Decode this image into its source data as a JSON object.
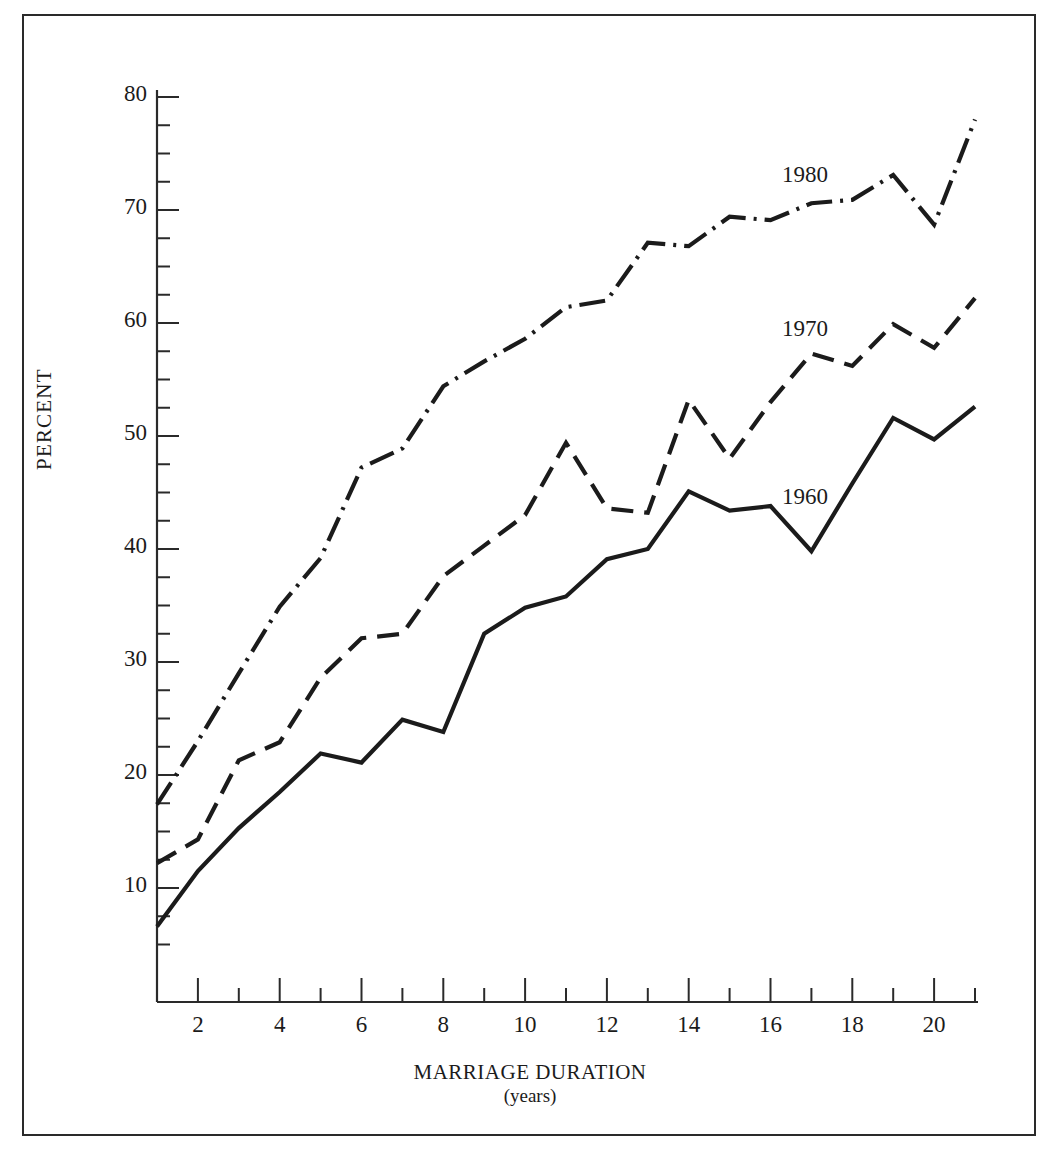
{
  "figure": {
    "border_color": "#2a2a2a",
    "background": "#ffffff"
  },
  "axes": {
    "y_title": "PERCENT",
    "x_title": "MARRIAGE  DURATION",
    "x_subtitle": "(years)",
    "y_tick_labels": [
      "80",
      "70",
      "60",
      "50",
      "40",
      "30",
      "20",
      "10"
    ],
    "x_tick_labels": [
      "2",
      "4",
      "6",
      "8",
      "10",
      "12",
      "14",
      "16",
      "18",
      "20"
    ]
  },
  "series_labels": {
    "s1980": "1980",
    "s1970": "1970",
    "s1960": "1960"
  },
  "chart_data": {
    "type": "line",
    "title": "",
    "xlabel": "MARRIAGE DURATION (years)",
    "ylabel": "PERCENT",
    "xlim": [
      1,
      21
    ],
    "ylim": [
      4,
      80
    ],
    "grid": false,
    "legend": "inline-labels",
    "x": [
      1,
      2,
      3,
      4,
      5,
      6,
      7,
      8,
      9,
      10,
      11,
      12,
      13,
      14,
      15,
      16,
      17,
      18,
      19,
      20,
      21
    ],
    "x_major_ticks": [
      2,
      4,
      6,
      8,
      10,
      12,
      14,
      16,
      18,
      20
    ],
    "x_minor_ticks": [
      1,
      3,
      5,
      7,
      9,
      11,
      13,
      15,
      17,
      19,
      21
    ],
    "y_major_ticks": [
      10,
      20,
      30,
      40,
      50,
      60,
      70,
      80
    ],
    "y_minor_ticks": [
      7.5,
      12.5,
      15,
      17.5,
      22.5,
      25,
      27.5,
      32.5,
      35,
      37.5,
      42.5,
      45,
      47.5,
      52.5,
      55,
      57.5,
      62.5,
      65,
      67.5,
      72.5,
      75,
      77.5
    ],
    "series": [
      {
        "name": "1980",
        "line_style": "dash-dot",
        "color": "#1b1b1b",
        "values": [
          17.4,
          23.0,
          29.0,
          34.9,
          39.2,
          47.2,
          48.9,
          54.4,
          56.6,
          58.6,
          61.4,
          62.0,
          67.1,
          66.8,
          69.4,
          69.1,
          70.6,
          70.9,
          73.1,
          68.7,
          78.0
        ]
      },
      {
        "name": "1970",
        "line_style": "dashed",
        "color": "#1b1b1b",
        "values": [
          12.2,
          14.3,
          21.3,
          22.9,
          28.6,
          32.1,
          32.5,
          37.6,
          40.3,
          43.0,
          49.4,
          43.6,
          43.2,
          53.2,
          48.0,
          53.0,
          57.3,
          56.2,
          59.9,
          57.8,
          62.2
        ]
      },
      {
        "name": "1960",
        "line_style": "solid",
        "color": "#1b1b1b",
        "values": [
          6.6,
          11.5,
          15.3,
          18.5,
          21.9,
          21.1,
          24.9,
          23.8,
          32.5,
          34.8,
          35.8,
          39.1,
          40.0,
          45.1,
          43.4,
          43.8,
          39.8,
          45.8,
          51.6,
          49.7,
          52.6
        ]
      }
    ]
  }
}
